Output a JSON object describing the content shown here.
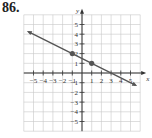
{
  "problem_number": "86.",
  "chart_data": {
    "type": "line",
    "title": "",
    "xlabel": "x",
    "ylabel": "y",
    "xlim": [
      -6,
      6
    ],
    "ylim": [
      -6,
      6
    ],
    "grid": true,
    "x_ticks": [
      -5,
      -4,
      -3,
      -2,
      -1,
      1,
      2,
      3,
      4,
      5
    ],
    "y_ticks": [
      5,
      4,
      3,
      2,
      1,
      -1,
      -2,
      -3,
      -4,
      -5
    ],
    "x_tick_labels": [
      "−5",
      "−4",
      "−3",
      "−2",
      "−1",
      "1",
      "2",
      "3",
      "4",
      "5"
    ],
    "y_tick_labels": [
      "5",
      "4",
      "3",
      "2",
      "1",
      "−1",
      "−2",
      "−3",
      "−4",
      "−5"
    ],
    "series": [
      {
        "name": "line",
        "equation": "y = -0.5x + 1.5",
        "slope": -0.5,
        "intercept": 1.5,
        "x": [
          -5.5,
          5.5
        ],
        "y": [
          4.25,
          -1.25
        ],
        "arrows": "both",
        "color": "#555555"
      }
    ],
    "points": [
      {
        "x": -1,
        "y": 2
      },
      {
        "x": 1,
        "y": 1
      }
    ]
  },
  "colors": {
    "grid": "#c8c8c8",
    "axis": "#333333",
    "line": "#555555",
    "point": "#555555"
  }
}
